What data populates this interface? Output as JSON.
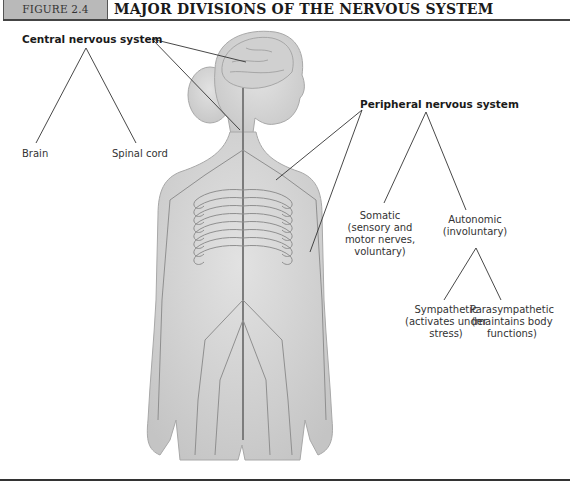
{
  "header": {
    "figure_label": "FIGURE 2.4",
    "title": "MAJOR DIVISIONS OF THE NERVOUS SYSTEM"
  },
  "diagram": {
    "illustration": "Female human figure showing brain, spinal cord and peripheral nerves",
    "central": {
      "title": "Central nervous system",
      "children": [
        {
          "label": "Brain"
        },
        {
          "label": "Spinal cord"
        }
      ]
    },
    "peripheral": {
      "title": "Peripheral nervous system",
      "children": [
        {
          "label": "Somatic",
          "lines": [
            "(sensory and",
            "motor nerves,",
            "voluntary)"
          ]
        },
        {
          "label": "Autonomic",
          "lines": [
            "(involuntary)"
          ],
          "children": [
            {
              "label": "Sympathetic",
              "lines": [
                "(activates under",
                "stress)"
              ]
            },
            {
              "label": "Parasympathetic",
              "lines": [
                "(maintains body",
                "functions)"
              ]
            }
          ]
        }
      ]
    }
  },
  "colors": {
    "header_box": "#b9b9b9",
    "rule": "#444444",
    "figure_fill": "#d4d4d4",
    "nerve": "#8a8a8a",
    "leader_line": "#333333"
  }
}
